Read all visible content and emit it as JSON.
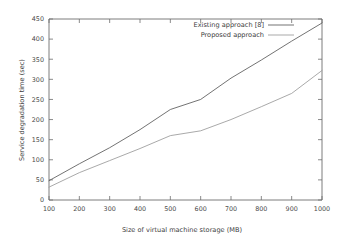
{
  "chart_data": {
    "type": "line",
    "title": "",
    "subtitle": "",
    "xlabel": "Size of virtual machine storage (MB)",
    "ylabel": "Service degradation time (sec)",
    "xlim": [
      100,
      1000
    ],
    "ylim": [
      0,
      450
    ],
    "xticks": [
      100,
      200,
      300,
      400,
      500,
      600,
      700,
      800,
      900,
      1000
    ],
    "yticks": [
      0,
      50,
      100,
      150,
      200,
      250,
      300,
      350,
      400,
      450
    ],
    "xtick_labels": [
      "100",
      "200",
      "300",
      "400",
      "500",
      "600",
      "700",
      "800",
      "900",
      "1000"
    ],
    "ytick_labels": [
      "0",
      "50",
      "100",
      "150",
      "200",
      "250",
      "300",
      "350",
      "400",
      "450"
    ],
    "grid": false,
    "legend_position": "top-right-inside",
    "x": [
      100,
      200,
      300,
      400,
      500,
      600,
      700,
      800,
      900,
      1000
    ],
    "series": [
      {
        "name": "Existing approach [8]",
        "color": "#5a5a5a",
        "values": [
          48,
          90,
          130,
          175,
          225,
          250,
          303,
          348,
          395,
          440
        ]
      },
      {
        "name": "Proposed approach",
        "color": "#9a9a9a",
        "values": [
          32,
          68,
          98,
          128,
          160,
          172,
          200,
          232,
          265,
          322
        ]
      }
    ],
    "annotations": []
  },
  "legend": {
    "entries": [
      {
        "label": "Existing approach [8]"
      },
      {
        "label": "Proposed approach"
      }
    ]
  },
  "axes": {
    "x_title": "Size of virtual machine storage (MB)",
    "y_title": "Service degradation time (sec)"
  },
  "colors": {
    "axis": "#6d6d6d",
    "text": "#3d3d3d",
    "series_existing": "#5a5a5a",
    "series_proposed": "#9a9a9a",
    "background": "#ffffff"
  }
}
